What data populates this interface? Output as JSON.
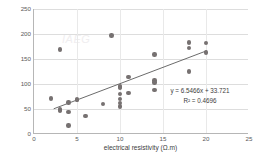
{
  "chart_data": {
    "type": "scatter",
    "title": "",
    "xlabel": "electrical resistivity (Ω.m)",
    "ylabel": "SPT-N (from surface wave)",
    "xlim": [
      0,
      25
    ],
    "ylim": [
      0,
      250
    ],
    "xticks": [
      "0",
      "5",
      "10",
      "15",
      "20",
      "25"
    ],
    "xtick_values": [
      0,
      5,
      10,
      15,
      20,
      25
    ],
    "yticks": [
      "0",
      "50",
      "100",
      "150",
      "200",
      "250"
    ],
    "ytick_values": [
      0,
      50,
      100,
      150,
      200,
      250
    ],
    "grid": "horizontal",
    "legend": "none",
    "point_color": "#767171",
    "line_color": "#595959",
    "series": [
      {
        "name": "SPT-N vs electrical resistivity",
        "x": [
          2,
          3,
          3,
          3,
          4,
          4,
          4,
          5,
          5,
          6,
          8,
          9,
          10,
          10,
          10,
          10,
          10,
          10,
          11,
          11,
          14,
          14,
          14,
          14,
          18,
          18,
          18,
          20,
          20
        ],
        "y": [
          71,
          169,
          47,
          49,
          63,
          44,
          17,
          69,
          68,
          36,
          60,
          197,
          95,
          93,
          80,
          70,
          62,
          55,
          114,
          82,
          159,
          107,
          103,
          88,
          183,
          172,
          125,
          182,
          163
        ]
      }
    ],
    "trendline": {
      "equation": "y = 6.5466x + 33.721",
      "r2_label": "R² = 0.4696",
      "slope": 6.5466,
      "intercept": 33.721,
      "r2": 0.4696,
      "x_start": 2.3,
      "x_end": 20.2
    },
    "watermark": "IAEG"
  }
}
